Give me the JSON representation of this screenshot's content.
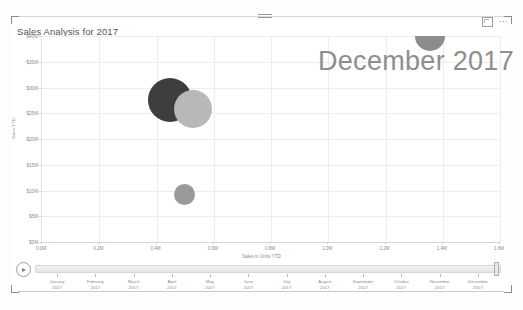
{
  "visual": {
    "title": "Sales Analysis for 2017",
    "watermark": "December 2017",
    "drag_handle": "drag-handle",
    "focus_mode_label": "Focus mode",
    "more_options_label": "More options"
  },
  "colors": {
    "bubble_dark": "#3e3e3e",
    "bubble_mid": "#9a9a9a",
    "bubble_light": "#b8b8b8",
    "gridline": "#ededed",
    "axis_text": "#8b8b8b",
    "watermark": "#8e8e8e",
    "title_text": "#555555"
  },
  "chart_data": {
    "type": "scatter",
    "title": "Sales Analysis for 2017",
    "annotation": "December 2017",
    "xlabel": "Sales in Units YTD",
    "ylabel": "Sales YTD",
    "grid": true,
    "legend": "none",
    "xlim": [
      0.0,
      1.6
    ],
    "ylim": [
      0,
      40
    ],
    "x_tick_labels": [
      "0.0M",
      "0.2M",
      "0.4M",
      "0.6M",
      "0.8M",
      "1.0M",
      "1.2M",
      "1.4M",
      "1.6M"
    ],
    "x_tick_values": [
      0.0,
      0.2,
      0.4,
      0.6,
      0.8,
      1.0,
      1.2,
      1.4,
      1.6
    ],
    "y_tick_labels": [
      "$0M",
      "$5M",
      "$10M",
      "$15M",
      "$20M",
      "$25M",
      "$30M",
      "$35M",
      "$40M"
    ],
    "y_tick_values": [
      0,
      5,
      10,
      15,
      20,
      25,
      30,
      35,
      40
    ],
    "points": [
      {
        "x": 0.45,
        "y": 27.5,
        "size": 44,
        "color": "#3e3e3e"
      },
      {
        "x": 0.53,
        "y": 25.8,
        "size": 38,
        "color": "#b8b8b8"
      },
      {
        "x": 0.5,
        "y": 9.2,
        "size": 21,
        "color": "#9a9a9a"
      },
      {
        "x": 1.36,
        "y": 40.0,
        "size": 30,
        "color": "#8c8c8c"
      }
    ]
  },
  "timeline": {
    "play_label": "Play",
    "selected": "December 2017",
    "year": "2017",
    "months": [
      "January",
      "February",
      "March",
      "April",
      "May",
      "June",
      "July",
      "August",
      "September",
      "October",
      "November",
      "December"
    ]
  }
}
